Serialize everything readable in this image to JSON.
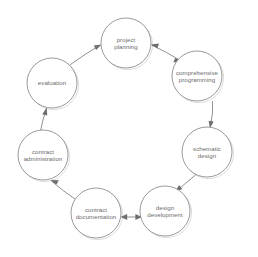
{
  "diagram": {
    "type": "cycle",
    "direction": "counter-clockwise",
    "node_count": 8,
    "stroke_color": "#8e8e8e",
    "text_color": "#6b6b6b",
    "background_color": "#ffffff",
    "nodes": [
      {
        "id": "project-planning",
        "label": "project\nplanning",
        "cx": 126,
        "cy": 43,
        "r": 25,
        "angle_deg": 270
      },
      {
        "id": "comprehensive-programming",
        "label": "comprehensive\nprogramming",
        "cx": 197,
        "cy": 76,
        "r": 25,
        "angle_deg": 315
      },
      {
        "id": "schematic-design",
        "label": "schematic\ndesign",
        "cx": 207,
        "cy": 152,
        "r": 25,
        "angle_deg": 0
      },
      {
        "id": "design-development",
        "label": "design\ndevelopment",
        "cx": 165,
        "cy": 211,
        "r": 25,
        "angle_deg": 45
      },
      {
        "id": "contract-documentation",
        "label": "contract\ndocumentation",
        "cx": 96,
        "cy": 213,
        "r": 25,
        "angle_deg": 90
      },
      {
        "id": "contract-administration",
        "label": "contract\nadministration",
        "cx": 43,
        "cy": 155,
        "r": 25,
        "angle_deg": 135
      },
      {
        "id": "evaluation",
        "label": "evaluation",
        "cx": 52,
        "cy": 83,
        "r": 25,
        "angle_deg": 180
      }
    ],
    "extra_node": {
      "id": "evaluation-top",
      "label": "evaluation",
      "cx": 52,
      "cy": 83,
      "r": 25
    },
    "arrows": [
      {
        "id": "arrow-evaluation-to-project-planning",
        "from": "evaluation",
        "to": "project-planning",
        "points": "72,63 99,44",
        "head_at": "99,44",
        "head_angle": -35
      },
      {
        "id": "arrow-project-planning-to-comprehensive-programming",
        "from": "project-planning",
        "to": "comprehensive-programming",
        "points": "152,44 180,60",
        "head_at": "180,60",
        "head_angle": 30
      },
      {
        "id": "arrow-comprehensive-programming-to-schematic-design",
        "from": "comprehensive-programming",
        "to": "schematic-design",
        "points": "213,96 210,126",
        "head_at": "210,126",
        "head_angle": 83
      },
      {
        "id": "arrow-schematic-design-to-design-development",
        "from": "schematic-design",
        "to": "design-development",
        "points": "194,174 176,190",
        "head_at": "176,190",
        "head_angle": 45
      },
      {
        "id": "arrow-design-development-to-contract-documentation",
        "from": "design-development",
        "to": "contract-documentation",
        "points": "139,216 122,216",
        "head_at": "122,216",
        "head_angle": 180
      },
      {
        "id": "arrow-contract-documentation-to-contract-administration",
        "from": "contract-documentation",
        "to": "contract-administration",
        "points": "74,197 51,180",
        "head_at": "51,180",
        "head_angle": -145
      },
      {
        "id": "arrow-contract-administration-to-evaluation",
        "from": "contract-administration",
        "to": "evaluation",
        "points": "41,130 46,109",
        "head_at": "46,109",
        "head_angle": -78
      }
    ]
  }
}
